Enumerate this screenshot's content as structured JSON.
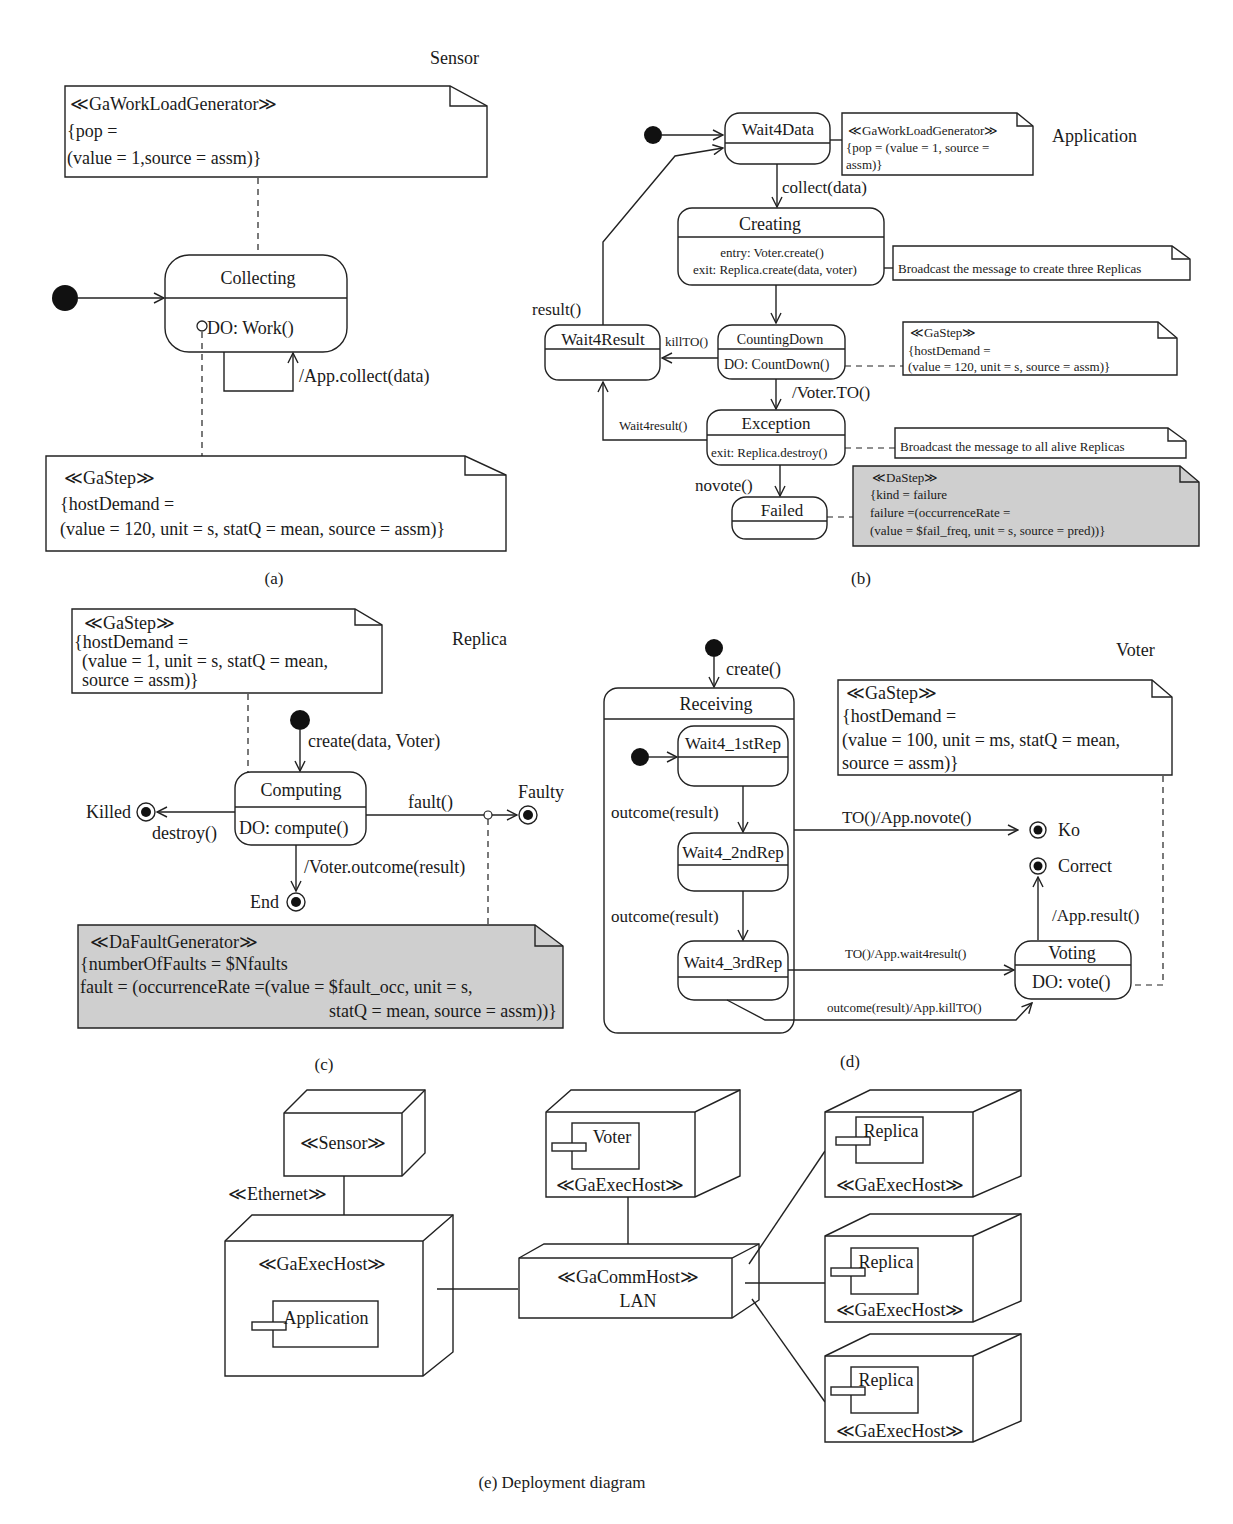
{
  "panels": {
    "a": {
      "caption": "(a)",
      "title": "Sensor",
      "note_workload": {
        "stereotype": "≪GaWorkLoadGenerator≫",
        "line1": "{pop =",
        "line2": "(value = 1,source = assm)}"
      },
      "state_collecting": {
        "name": "Collecting",
        "activity": "DO: Work()"
      },
      "self_transition": "/App.collect(data)",
      "note_gastep": {
        "stereotype": "≪GaStep≫",
        "line1": "{hostDemand =",
        "line2": "(value = 120, unit = s, statQ = mean, source = assm)}"
      }
    },
    "b": {
      "caption": "(b)",
      "title": "Application",
      "states": {
        "wait4data": {
          "name": "Wait4Data"
        },
        "creating": {
          "name": "Creating",
          "entry": "entry: Voter.create()",
          "exit": "exit: Replica.create(data, voter)"
        },
        "wait4result": {
          "name": "Wait4Result"
        },
        "countingdown": {
          "name": "CountingDown",
          "activity": "DO: CountDown()"
        },
        "exception": {
          "name": "Exception",
          "exit": "exit: Replica.destroy()"
        },
        "failed": {
          "name": "Failed"
        }
      },
      "transitions": {
        "collect": "collect(data)",
        "result": "result()",
        "killto": "killTO()",
        "voter_to": "/Voter.TO()",
        "wait4result": "Wait4result()",
        "novote": "novote()"
      },
      "note_workload": {
        "stereotype": "≪GaWorkLoadGenerator≫",
        "line1": "{pop = (value = 1, source =",
        "line2": "assm)}"
      },
      "note_broadcast_create": "Broadcast the message to create three Replicas",
      "note_gastep": {
        "stereotype": "≪GaStep≫",
        "line1": "{hostDemand =",
        "line2": "(value = 120, unit = s, source = assm)}"
      },
      "note_broadcast_alive": "Broadcast the message to all alive Replicas",
      "note_dastep": {
        "stereotype": "≪DaStep≫",
        "line1": "{kind = failure",
        "line2": "failure =(occurrenceRate =",
        "line3": "(value = $fail_freq, unit = s, source = pred))}"
      }
    },
    "c": {
      "caption": "(c)",
      "title": "Replica",
      "note_gastep": {
        "stereotype": "≪GaStep≫",
        "line1": "{hostDemand =",
        "line2": "(value = 1, unit = s, statQ = mean,",
        "line3": "source = assm)}"
      },
      "initial_transition": "create(data, Voter)",
      "state_computing": {
        "name": "Computing",
        "activity": "DO: compute()"
      },
      "final_states": {
        "killed": "Killed",
        "faulty": "Faulty",
        "end": "End"
      },
      "transitions": {
        "destroy": "destroy()",
        "fault": "fault()",
        "outcome": "/Voter.outcome(result)"
      },
      "note_fault": {
        "stereotype": "≪DaFaultGenerator≫",
        "line1": "{numberOfFaults = $Nfaults",
        "line2": " fault = (occurrenceRate =(value = $fault_occ, unit = s,",
        "line3": "statQ = mean, source = assm))}"
      }
    },
    "d": {
      "caption": "(d)",
      "title": "Voter",
      "initial_transition": "create()",
      "composite": {
        "name": "Receiving"
      },
      "states": {
        "rep1": {
          "name": "Wait4_1stRep"
        },
        "rep2": {
          "name": "Wait4_2ndRep"
        },
        "rep3": {
          "name": "Wait4_3rdRep"
        },
        "voting": {
          "name": "Voting",
          "activity": "DO: vote()"
        }
      },
      "transitions": {
        "outcome1": "outcome(result)",
        "outcome2": "outcome(result)",
        "novote": "TO()/App.novote()",
        "wait4result": "TO()/App.wait4result()",
        "killto": "outcome(result)/App.killTO()",
        "result": "/App.result()"
      },
      "final_states": {
        "ko": "Ko",
        "correct": "Correct"
      },
      "note_gastep": {
        "stereotype": "≪GaStep≫",
        "line1": "{hostDemand =",
        "line2": "(value = 100, unit = ms, statQ = mean,",
        "line3": "source = assm)}"
      }
    },
    "e": {
      "caption": "(e)  Deployment diagram",
      "nodes": {
        "sensor": "≪Sensor≫",
        "ethernet": "≪Ethernet≫",
        "app_host": "≪GaExecHost≫",
        "app_component": "Application",
        "voter_component": "Voter",
        "voter_host": "≪GaExecHost≫",
        "comm_stereotype": "≪GaCommHost≫",
        "comm_name": "LAN",
        "replicas": [
          {
            "component": "Replica",
            "host": "≪GaExecHost≫"
          },
          {
            "component": "Replica",
            "host": "≪GaExecHost≫"
          },
          {
            "component": "Replica",
            "host": "≪GaExecHost≫"
          }
        ]
      }
    }
  },
  "colors": {
    "line": "#222222",
    "note_shaded": "#cfcfcf",
    "background": "#ffffff"
  }
}
